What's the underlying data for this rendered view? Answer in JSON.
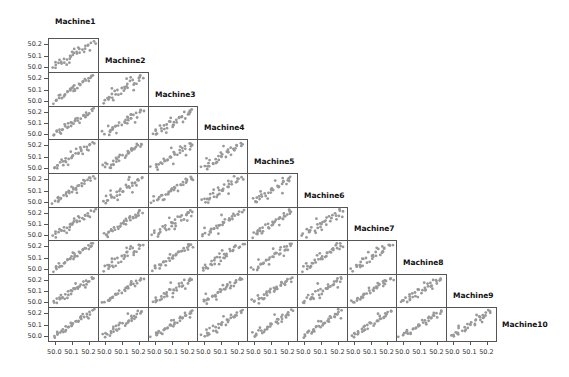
{
  "chart_data": {
    "type": "scatter",
    "variables": [
      "Machine1",
      "Machine2",
      "Machine3",
      "Machine4",
      "Machine5",
      "Machine6",
      "Machine7",
      "Machine8",
      "Machine9",
      "Machine10"
    ],
    "axis_range": [
      49.97,
      50.24
    ],
    "tick_labels": [
      "50.0",
      "50.1",
      "50.2"
    ],
    "tick_values": [
      50.0,
      50.1,
      50.2
    ],
    "layout": "lower-triangular matrix; variable labels on diagonal",
    "point_color": "#999999",
    "border_color": "#555555",
    "observations": [
      [
        49.99,
        50.0,
        49.98,
        50.0,
        50.01,
        49.99,
        50.0,
        49.98,
        50.0,
        49.99
      ],
      [
        50.0,
        50.02,
        50.01,
        49.99,
        50.0,
        50.01,
        49.98,
        50.0,
        50.01,
        50.0
      ],
      [
        50.01,
        49.99,
        50.0,
        50.02,
        50.02,
        50.0,
        50.01,
        50.02,
        49.99,
        50.01
      ],
      [
        50.02,
        50.03,
        50.02,
        50.01,
        49.99,
        50.03,
        50.02,
        50.01,
        50.02,
        50.03
      ],
      [
        50.03,
        50.02,
        50.04,
        50.03,
        50.04,
        50.02,
        50.03,
        50.04,
        50.03,
        50.02
      ],
      [
        50.04,
        50.05,
        50.03,
        50.05,
        50.03,
        50.04,
        50.05,
        50.03,
        50.05,
        50.04
      ],
      [
        50.05,
        50.04,
        50.06,
        50.04,
        50.06,
        50.06,
        50.04,
        50.06,
        50.04,
        50.06
      ],
      [
        50.06,
        50.07,
        50.05,
        50.07,
        50.05,
        50.05,
        50.07,
        50.05,
        50.07,
        50.05
      ],
      [
        50.07,
        50.06,
        50.08,
        50.06,
        50.08,
        50.08,
        50.06,
        50.08,
        50.06,
        50.08
      ],
      [
        50.08,
        50.09,
        50.07,
        50.09,
        50.07,
        50.07,
        50.09,
        50.07,
        50.09,
        50.07
      ],
      [
        50.09,
        50.08,
        50.1,
        50.08,
        50.1,
        50.1,
        50.08,
        50.1,
        50.08,
        50.1
      ],
      [
        50.1,
        50.11,
        50.09,
        50.11,
        50.09,
        50.09,
        50.11,
        50.09,
        50.11,
        50.09
      ],
      [
        50.1,
        50.09,
        50.11,
        50.1,
        50.11,
        50.11,
        50.1,
        50.11,
        50.1,
        50.11
      ],
      [
        50.11,
        50.12,
        50.1,
        50.12,
        50.1,
        50.12,
        50.12,
        50.1,
        50.12,
        50.1
      ],
      [
        50.12,
        50.11,
        50.13,
        50.11,
        50.12,
        50.1,
        50.11,
        50.13,
        50.11,
        50.12
      ],
      [
        50.13,
        50.14,
        50.12,
        50.13,
        50.14,
        50.13,
        50.14,
        50.12,
        50.13,
        50.14
      ],
      [
        50.14,
        50.13,
        50.15,
        50.15,
        50.13,
        50.15,
        50.13,
        50.15,
        50.14,
        50.13
      ],
      [
        50.15,
        50.16,
        50.14,
        50.14,
        50.15,
        50.14,
        50.16,
        50.14,
        50.16,
        50.15
      ],
      [
        50.16,
        50.15,
        50.17,
        50.17,
        50.16,
        50.16,
        50.15,
        50.17,
        50.15,
        50.17
      ],
      [
        50.17,
        50.18,
        50.16,
        50.16,
        50.18,
        50.18,
        50.17,
        50.16,
        50.18,
        50.16
      ],
      [
        50.18,
        50.17,
        50.19,
        50.18,
        50.17,
        50.17,
        50.19,
        50.19,
        50.17,
        50.18
      ],
      [
        50.19,
        50.2,
        50.18,
        50.2,
        50.19,
        50.2,
        50.18,
        50.18,
        50.2,
        50.2
      ],
      [
        50.2,
        50.19,
        50.2,
        50.19,
        50.21,
        50.19,
        50.2,
        50.21,
        50.19,
        50.19
      ],
      [
        50.21,
        50.21,
        50.22,
        50.21,
        50.2,
        50.21,
        50.22,
        50.2,
        50.21,
        50.21
      ],
      [
        50.22,
        50.22,
        50.21,
        50.22,
        50.22,
        50.22,
        50.21,
        50.22,
        50.22,
        50.22
      ],
      [
        50.03,
        50.07,
        50.06,
        50.01,
        50.08,
        50.02,
        50.06,
        50.03,
        50.07,
        50.05
      ],
      [
        50.08,
        50.04,
        50.11,
        50.06,
        50.03,
        50.1,
        50.05,
        50.09,
        50.04,
        50.08
      ],
      [
        50.12,
        50.16,
        50.09,
        50.14,
        50.17,
        50.08,
        50.15,
        50.12,
        50.17,
        50.13
      ],
      [
        50.17,
        50.13,
        50.19,
        50.15,
        50.12,
        50.19,
        50.14,
        50.18,
        50.13,
        50.19
      ],
      [
        50.06,
        50.01,
        50.03,
        50.08,
        50.05,
        50.06,
        50.01,
        50.04,
        50.02,
        50.03
      ],
      [
        50.14,
        50.18,
        50.16,
        50.11,
        50.19,
        50.15,
        50.18,
        50.16,
        50.15,
        50.17
      ],
      [
        50.2,
        50.15,
        50.21,
        50.18,
        50.16,
        50.22,
        50.17,
        50.2,
        50.19,
        50.16
      ],
      [
        50.01,
        50.04,
        50.0,
        50.03,
        50.02,
        50.04,
        50.03,
        50.01,
        50.03,
        50.02
      ],
      [
        50.1,
        50.13,
        50.12,
        50.09,
        50.14,
        50.13,
        50.09,
        50.14,
        50.12,
        50.11
      ],
      [
        50.23,
        50.2,
        50.22,
        50.23,
        50.21,
        50.2,
        50.23,
        50.22,
        50.21,
        50.23
      ]
    ]
  },
  "labels": {
    "m1": "Machine1",
    "m2": "Machine2",
    "m3": "Machine3",
    "m4": "Machine4",
    "m5": "Machine5",
    "m6": "Machine6",
    "m7": "Machine7",
    "m8": "Machine8",
    "m9": "Machine9",
    "m10": "Machine10"
  }
}
